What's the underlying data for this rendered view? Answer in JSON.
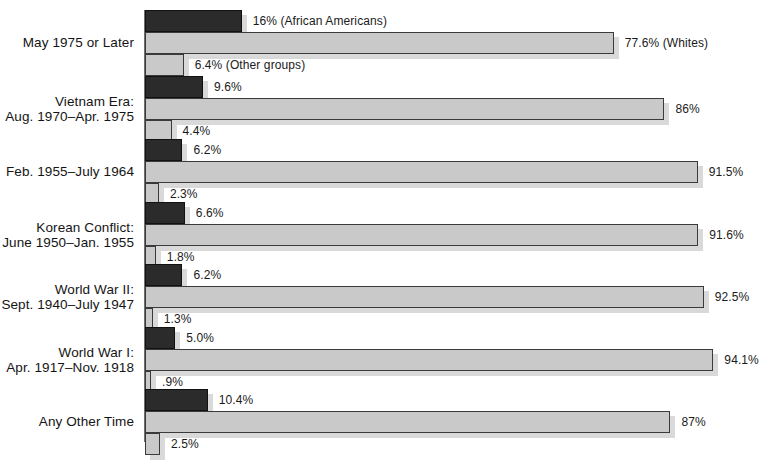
{
  "chart": {
    "title": "",
    "x_left_px": 145,
    "px_per_percent": 6.04
  },
  "chart_data": {
    "type": "bar",
    "title": "",
    "xlabel": "",
    "ylabel": "",
    "orientation": "horizontal",
    "grid": false,
    "legend_position": "inline-annotation",
    "xlim": [
      0,
      100
    ],
    "series": [
      {
        "name": "African Americans",
        "color": "#2b2b2b"
      },
      {
        "name": "Whites",
        "color": "#c9c9c9"
      },
      {
        "name": "Other groups",
        "color": "#c9c9c9"
      }
    ],
    "categories": [
      "May 1975 or Later",
      "Vietnam Era: Aug. 1970–Apr. 1975",
      "Feb. 1955–July 1964",
      "Korean Conflict: June 1950–Jan. 1955",
      "World War II: Sept. 1940–July 1947",
      "World War I: Apr. 1917–Nov. 1918",
      "Any Other Time"
    ],
    "values": {
      "African Americans": [
        16,
        9.6,
        6.2,
        6.6,
        6.2,
        5.0,
        10.4
      ],
      "Whites": [
        77.6,
        86,
        91.5,
        91.6,
        92.5,
        94.1,
        87
      ],
      "Other groups": [
        6.4,
        4.4,
        2.3,
        1.8,
        1.3,
        0.9,
        2.5
      ]
    }
  },
  "groups": [
    {
      "label_line1": "May 1975 or Later",
      "label_line2": "",
      "top": 10,
      "bars": [
        {
          "name": "african-americans",
          "value": 16,
          "label": "16% (African Americans)",
          "style": "dark"
        },
        {
          "name": "whites",
          "value": 77.6,
          "label": "77.6% (Whites)",
          "style": "light"
        },
        {
          "name": "other-groups",
          "value": 6.4,
          "label": "6.4% (Other groups)",
          "style": "light"
        }
      ]
    },
    {
      "label_line1": "Vietnam Era:",
      "label_line2": "Aug. 1970–Apr. 1975",
      "top": 76,
      "bars": [
        {
          "name": "african-americans",
          "value": 9.6,
          "label": "9.6%",
          "style": "dark"
        },
        {
          "name": "whites",
          "value": 86,
          "label": "86%",
          "style": "light"
        },
        {
          "name": "other-groups",
          "value": 4.4,
          "label": "4.4%",
          "style": "light"
        }
      ]
    },
    {
      "label_line1": "Feb. 1955–July 1964",
      "label_line2": "",
      "top": 139,
      "bars": [
        {
          "name": "african-americans",
          "value": 6.2,
          "label": "6.2%",
          "style": "dark"
        },
        {
          "name": "whites",
          "value": 91.5,
          "label": "91.5%",
          "style": "light"
        },
        {
          "name": "other-groups",
          "value": 2.3,
          "label": "2.3%",
          "style": "light"
        }
      ]
    },
    {
      "label_line1": "Korean Conflict:",
      "label_line2": "June 1950–Jan. 1955",
      "top": 202,
      "bars": [
        {
          "name": "african-americans",
          "value": 6.6,
          "label": "6.6%",
          "style": "dark"
        },
        {
          "name": "whites",
          "value": 91.6,
          "label": "91.6%",
          "style": "light"
        },
        {
          "name": "other-groups",
          "value": 1.8,
          "label": "1.8%",
          "style": "light"
        }
      ]
    },
    {
      "label_line1": "World War II:",
      "label_line2": "Sept. 1940–July 1947",
      "top": 264,
      "bars": [
        {
          "name": "african-americans",
          "value": 6.2,
          "label": "6.2%",
          "style": "dark"
        },
        {
          "name": "whites",
          "value": 92.5,
          "label": "92.5%",
          "style": "light"
        },
        {
          "name": "other-groups",
          "value": 1.3,
          "label": "1.3%",
          "style": "light"
        }
      ]
    },
    {
      "label_line1": "World War I:",
      "label_line2": "Apr. 1917–Nov. 1918",
      "top": 327,
      "bars": [
        {
          "name": "african-americans",
          "value": 5.0,
          "label": "5.0%",
          "style": "dark"
        },
        {
          "name": "whites",
          "value": 94.1,
          "label": "94.1%",
          "style": "light"
        },
        {
          "name": "other-groups",
          "value": 0.9,
          "label": ".9%",
          "style": "light"
        }
      ]
    },
    {
      "label_line1": "Any Other Time",
      "label_line2": "",
      "top": 389,
      "bars": [
        {
          "name": "african-americans",
          "value": 10.4,
          "label": "10.4%",
          "style": "dark"
        },
        {
          "name": "whites",
          "value": 87,
          "label": "87%",
          "style": "light"
        },
        {
          "name": "other-groups",
          "value": 2.5,
          "label": "2.5%",
          "style": "light"
        }
      ]
    }
  ]
}
